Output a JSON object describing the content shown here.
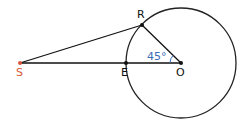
{
  "diagram": {
    "points": {
      "S": {
        "label": "S",
        "x": 20,
        "y": 63,
        "color": "#d9583a"
      },
      "E": {
        "label": "E",
        "x": 126,
        "y": 63,
        "color": "#111111"
      },
      "O": {
        "label": "O",
        "x": 181,
        "y": 63,
        "color": "#111111"
      },
      "R": {
        "label": "R",
        "x": 142,
        "y": 25,
        "color": "#111111"
      }
    },
    "circle": {
      "center": "O",
      "radius": 55
    },
    "angle": {
      "label": "45°",
      "vertex": "O",
      "color": "#3d6db5"
    },
    "segments": [
      "SR",
      "SO",
      "RO"
    ]
  }
}
